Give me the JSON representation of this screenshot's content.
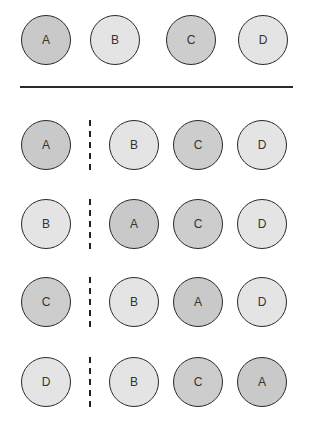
{
  "colors": {
    "A": "#c9c9c9",
    "B": "#e4e4e4",
    "C": "#cdcdcd",
    "D": "#e4e4e4"
  },
  "top_row": [
    "A",
    "B",
    "C",
    "D"
  ],
  "rows": [
    {
      "left": "A",
      "right": [
        "B",
        "C",
        "D"
      ]
    },
    {
      "left": "B",
      "right": [
        "A",
        "C",
        "D"
      ]
    },
    {
      "left": "C",
      "right": [
        "B",
        "A",
        "D"
      ]
    },
    {
      "left": "D",
      "right": [
        "B",
        "C",
        "A"
      ]
    }
  ]
}
